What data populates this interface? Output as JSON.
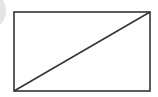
{
  "diagram": {
    "rectangle": {
      "x": 14,
      "y": 12,
      "width": 136,
      "height": 79
    },
    "diagonal": {
      "from": "bottom-left",
      "to": "top-right"
    },
    "colors": {
      "stroke": "#333333",
      "background": "#ffffff",
      "partial_shape": "#d9d9d9"
    }
  }
}
